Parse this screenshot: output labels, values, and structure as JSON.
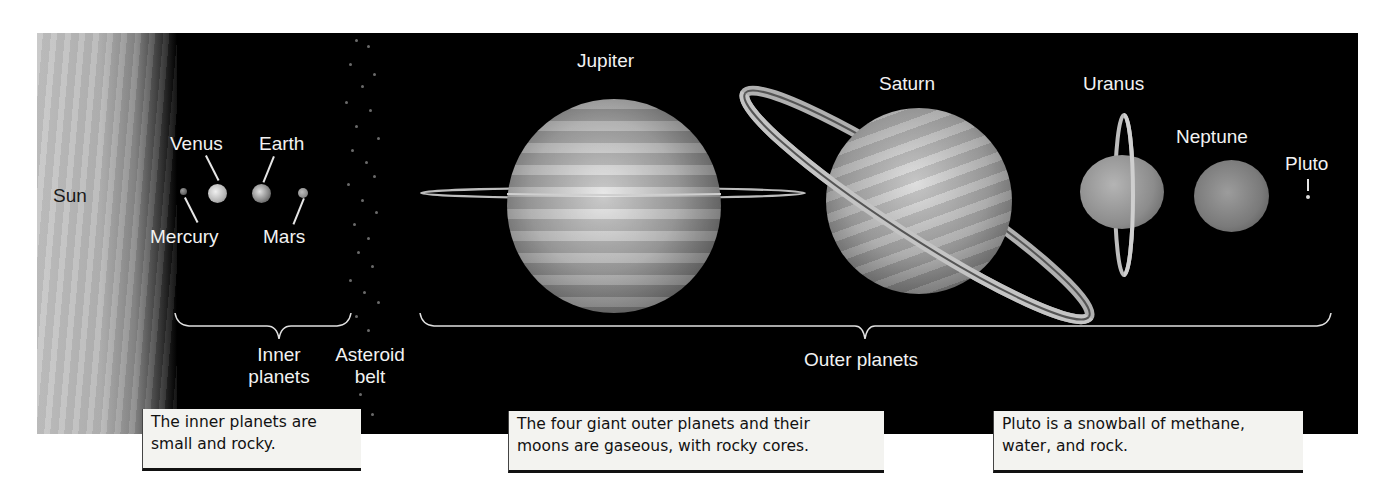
{
  "diagram": {
    "background_color": "#000000",
    "regions": {
      "sun": "Sun",
      "inner_group": "Inner\nplanets",
      "inner_group_lines": [
        "Inner",
        "planets"
      ],
      "asteroid_belt_lines": [
        "Asteroid",
        "belt"
      ],
      "outer_group": "Outer planets"
    },
    "planets": {
      "mercury": "Mercury",
      "venus": "Venus",
      "earth": "Earth",
      "mars": "Mars",
      "jupiter": "Jupiter",
      "saturn": "Saturn",
      "uranus": "Uranus",
      "neptune": "Neptune",
      "pluto": "Pluto"
    },
    "captions": {
      "inner": [
        "The inner planets are",
        "small and rocky."
      ],
      "outer": [
        "The four giant outer planets and their",
        "moons are gaseous, with rocky cores."
      ],
      "pluto": [
        "Pluto is a snowball of methane,",
        "water, and rock."
      ]
    }
  }
}
